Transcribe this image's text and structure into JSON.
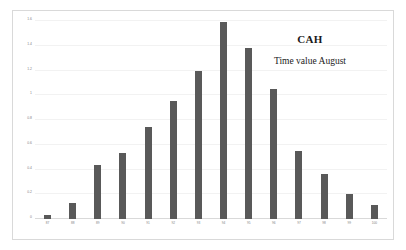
{
  "chart_data": {
    "type": "bar",
    "title": "CAH",
    "subtitle": "Time value August",
    "xlabel": "",
    "ylabel": "",
    "ylim": [
      0,
      1.6
    ],
    "grid": true,
    "legend": "none",
    "bar_color": "#595959",
    "yticks": [
      "0",
      "0.2",
      "0.4",
      "0.6",
      "0.8",
      "1",
      "1.2",
      "1.4",
      "1.6"
    ],
    "ytick_values": [
      0,
      0.2,
      0.4,
      0.6,
      0.8,
      1,
      1.2,
      1.4,
      1.6
    ],
    "categories": [
      "87",
      "88",
      "89",
      "90",
      "91",
      "92",
      "93",
      "94",
      "95",
      "96",
      "97",
      "98",
      "99",
      "100"
    ],
    "values": [
      0.03,
      0.13,
      0.44,
      0.53,
      0.74,
      0.95,
      1.2,
      1.59,
      1.38,
      1.05,
      0.55,
      0.36,
      0.2,
      0.11
    ]
  }
}
